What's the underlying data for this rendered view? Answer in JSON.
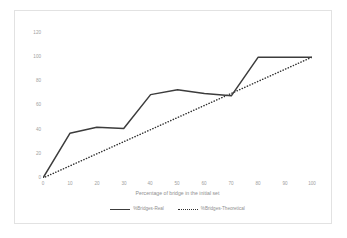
{
  "chart_data": {
    "type": "line",
    "title": "",
    "xlabel": "Percentage of bridge in the initial set",
    "ylabel": "",
    "xlim": [
      0,
      100
    ],
    "ylim": [
      0,
      120
    ],
    "grid": false,
    "legend_position": "bottom",
    "x": [
      0,
      10,
      20,
      30,
      40,
      50,
      60,
      70,
      80,
      90,
      100
    ],
    "xticks": [
      "0",
      "10",
      "20",
      "30",
      "40",
      "50",
      "60",
      "70",
      "80",
      "90",
      "100"
    ],
    "yticks": [
      "0",
      "20",
      "40",
      "60",
      "80",
      "100",
      "120"
    ],
    "series": [
      {
        "name": "%Bridges-Real",
        "style": "solid",
        "color": "#3c3c3c",
        "values": [
          0,
          37,
          42,
          41,
          69,
          73,
          70,
          68,
          100,
          100,
          100
        ]
      },
      {
        "name": "%Bridges-Theoretical",
        "style": "dotted",
        "color": "#2f2f2f",
        "values": [
          0,
          10,
          20,
          30,
          40,
          50,
          60,
          70,
          80,
          90,
          100
        ]
      }
    ]
  },
  "axes": {
    "x_title": "Percentage of bridge in the initial set",
    "x_ticks": [
      "0",
      "10",
      "20",
      "30",
      "40",
      "50",
      "60",
      "70",
      "80",
      "90",
      "100"
    ],
    "y_ticks": [
      "120",
      "100",
      "80",
      "60",
      "40",
      "20",
      "0"
    ]
  },
  "legend": {
    "items": [
      {
        "label": "%Bridges-Real"
      },
      {
        "label": "%Bridges-Theoretical"
      }
    ]
  },
  "colors": {
    "real_line": "#3c3c3c",
    "theoretical_line": "#2f2f2f",
    "frame": "#e2e2e2",
    "tick_text": "#a0a0a0",
    "background": "#ffffff"
  }
}
